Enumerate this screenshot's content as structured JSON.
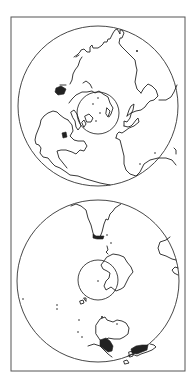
{
  "figure": {
    "background": "#ffffff",
    "line_color": "#222222",
    "frame": {
      "x": 11,
      "y": 17,
      "width": 174,
      "height": 354
    },
    "panels": [
      {
        "name": "northern-hemisphere",
        "globe": {
          "cx": 98,
          "cy": 106,
          "r": 80
        },
        "polar_circle": {
          "cx": 98,
          "cy": 113,
          "r": 21
        },
        "visible_features": [
          "North America",
          "Greenland",
          "Europe",
          "Asia",
          "Africa",
          "Arctic Ocean",
          "Canadian Arctic Archipelago"
        ]
      },
      {
        "name": "southern-hemisphere",
        "globe": {
          "cx": 98,
          "cy": 281,
          "r": 81
        },
        "polar_circle": {
          "cx": 98,
          "cy": 280,
          "r": 20
        },
        "visible_features": [
          "Antarctica",
          "South America (tip)",
          "Australia",
          "Indonesia",
          "Africa (tip)"
        ]
      }
    ]
  }
}
